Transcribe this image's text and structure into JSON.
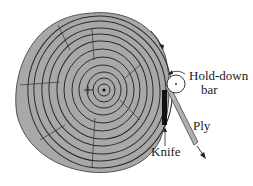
{
  "diagram": {
    "labels": {
      "hold_down_bar_line1": "Hold-down",
      "hold_down_bar_line2": "bar",
      "ply": "Ply",
      "knife": "Knife"
    },
    "colors": {
      "log_fill": "#a8a8a8",
      "ring_stroke": "#2a2a2a",
      "knife": "#111111",
      "ply_fill": "#b0b0b0",
      "text": "#1a1a1a"
    }
  }
}
